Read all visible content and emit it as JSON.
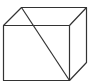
{
  "diagram": {
    "type": "cube-wireframe",
    "stroke_color": "#333333",
    "background": "#ffffff",
    "vertices": {
      "front_top_left": [
        3.5,
        25.5
      ],
      "front_top_right": [
        69.5,
        25.5
      ],
      "front_bottom_left": [
        3.5,
        80.5
      ],
      "front_bottom_right": [
        69.5,
        80.5
      ],
      "back_top_left": [
        21.5,
        7.5
      ],
      "back_top_right": [
        86.5,
        7.5
      ],
      "back_bottom_right": [
        86.5,
        62.5
      ]
    },
    "diagonal": {
      "from": "back_top_left",
      "to": "front_bottom_right"
    }
  }
}
